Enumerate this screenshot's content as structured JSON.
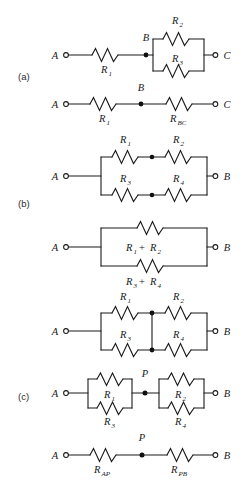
{
  "figure": {
    "type": "circuit-diagram",
    "width": 252,
    "height": 483,
    "background_color": "#ffffff",
    "ink_color": "#1a1a1a",
    "panels": [
      {
        "id": "a",
        "label": "(a)",
        "label_x": 18,
        "label_y": 80,
        "circuits": [
          {
            "id": "a1",
            "description": "R1 in series with parallel combination of R2 and R3 between terminals A and C, node B between them",
            "terminals": [
              {
                "name": "A",
                "x": 64,
                "y": 55
              },
              {
                "name": "C",
                "x": 218,
                "y": 55
              }
            ],
            "nodes": [
              {
                "name": "B",
                "x": 146,
                "y": 55
              }
            ],
            "resistors": [
              {
                "name": "R",
                "sub": "1",
                "x": 106,
                "y": 55,
                "orient": "h",
                "label_pos": "below"
              },
              {
                "name": "R",
                "sub": "2",
                "x": 178,
                "y": 39,
                "orient": "h",
                "label_pos": "above"
              },
              {
                "name": "R",
                "sub": "3",
                "x": 178,
                "y": 71,
                "orient": "h",
                "label_pos": "above"
              }
            ]
          },
          {
            "id": "a2",
            "description": "Simplified: R1 in series with equivalent R_BC between A and C via node B",
            "terminals": [
              {
                "name": "A",
                "x": 64,
                "y": 104
              },
              {
                "name": "C",
                "x": 218,
                "y": 104
              }
            ],
            "nodes": [
              {
                "name": "B",
                "x": 141,
                "y": 104
              }
            ],
            "resistors": [
              {
                "name": "R",
                "sub": "1",
                "x": 104,
                "y": 104,
                "orient": "h",
                "label_pos": "below"
              },
              {
                "name": "R",
                "sub": "BC",
                "x": 180,
                "y": 104,
                "orient": "h",
                "label_pos": "below"
              }
            ]
          }
        ]
      },
      {
        "id": "b",
        "label": "(b)",
        "label_x": 18,
        "label_y": 207,
        "circuits": [
          {
            "id": "b1",
            "description": "Two branches in parallel between A and B: top branch R1 then R2, bottom branch R3 then R4, with junction dots at branch midpoints",
            "terminals": [
              {
                "name": "A",
                "x": 64,
                "y": 176
              },
              {
                "name": "B",
                "x": 218,
                "y": 176
              }
            ],
            "resistors": [
              {
                "name": "R",
                "sub": "1",
                "x": 127,
                "y": 157,
                "orient": "h",
                "label_pos": "above"
              },
              {
                "name": "R",
                "sub": "2",
                "x": 180,
                "y": 157,
                "orient": "h",
                "label_pos": "above"
              },
              {
                "name": "R",
                "sub": "3",
                "x": 127,
                "y": 195,
                "orient": "h",
                "label_pos": "above"
              },
              {
                "name": "R",
                "sub": "4",
                "x": 180,
                "y": 195,
                "orient": "h",
                "label_pos": "above"
              }
            ]
          },
          {
            "id": "b2",
            "description": "Simplified: parallel of series sums (R1 + R2) on top branch and (R3 + R4) on bottom branch, between A and B",
            "terminals": [
              {
                "name": "A",
                "x": 64,
                "y": 247
              },
              {
                "name": "B",
                "x": 218,
                "y": 247
              }
            ],
            "branch_labels": [
              {
                "text": "R_1 + R_2",
                "x": 152,
                "y": 249,
                "position": "inside"
              },
              {
                "text": "R_3 + R_4",
                "x": 152,
                "y": 283,
                "position": "below"
              }
            ],
            "resistors": [
              {
                "name": "",
                "sub": "",
                "x": 152,
                "y": 228,
                "orient": "h",
                "label_pos": "none"
              },
              {
                "name": "",
                "sub": "",
                "x": 152,
                "y": 266,
                "orient": "h",
                "label_pos": "none"
              }
            ]
          }
        ]
      },
      {
        "id": "c",
        "label": "(c)",
        "label_x": 18,
        "label_y": 400,
        "circuits": [
          {
            "id": "c1",
            "description": "Bridge-like network: top branch R1 then R2, bottom branch R3 then R4, with a vertical wire shorting the two midpoint junctions, between A and B",
            "terminals": [
              {
                "name": "A",
                "x": 64,
                "y": 331
              },
              {
                "name": "B",
                "x": 218,
                "y": 331
              }
            ],
            "resistors": [
              {
                "name": "R",
                "sub": "1",
                "x": 127,
                "y": 313,
                "orient": "h",
                "label_pos": "above"
              },
              {
                "name": "R",
                "sub": "2",
                "x": 180,
                "y": 313,
                "orient": "h",
                "label_pos": "above"
              },
              {
                "name": "R",
                "sub": "3",
                "x": 127,
                "y": 350,
                "orient": "h",
                "label_pos": "above"
              },
              {
                "name": "R",
                "sub": "4",
                "x": 180,
                "y": 350,
                "orient": "h",
                "label_pos": "above"
              }
            ]
          },
          {
            "id": "c2",
            "description": "Redrawn: R1 parallel R3 in series with R2 parallel R4, joined at node P, between A and B",
            "terminals": [
              {
                "name": "A",
                "x": 64,
                "y": 393
              },
              {
                "name": "B",
                "x": 218,
                "y": 393
              }
            ],
            "nodes": [
              {
                "name": "P",
                "x": 145,
                "y": 393
              }
            ],
            "resistors": [
              {
                "name": "R",
                "sub": "1",
                "x": 110,
                "y": 379,
                "orient": "h",
                "label_pos": "inside"
              },
              {
                "name": "R",
                "sub": "3",
                "x": 110,
                "y": 408,
                "orient": "h",
                "label_pos": "below"
              },
              {
                "name": "R",
                "sub": "2",
                "x": 182,
                "y": 379,
                "orient": "h",
                "label_pos": "inside"
              },
              {
                "name": "R",
                "sub": "4",
                "x": 182,
                "y": 408,
                "orient": "h",
                "label_pos": "below"
              }
            ]
          },
          {
            "id": "c3",
            "description": "Final simplification: R_AP in series with R_PB through node P, between A and B",
            "terminals": [
              {
                "name": "A",
                "x": 64,
                "y": 455
              },
              {
                "name": "B",
                "x": 218,
                "y": 455
              }
            ],
            "nodes": [
              {
                "name": "P",
                "x": 142,
                "y": 455
              }
            ],
            "resistors": [
              {
                "name": "R",
                "sub": "AP",
                "x": 104,
                "y": 455,
                "orient": "h",
                "label_pos": "below"
              },
              {
                "name": "R",
                "sub": "PB",
                "x": 181,
                "y": 455,
                "orient": "h",
                "label_pos": "below"
              }
            ]
          }
        ]
      }
    ],
    "symbols": {
      "resistor": "zigzag",
      "terminal": "open-circle",
      "junction": "filled-dot"
    },
    "text": {
      "panel_a": "(a)",
      "panel_b": "(b)",
      "panel_c": "(c)",
      "A": "A",
      "B": "B",
      "C": "C",
      "P": "P",
      "R": "R",
      "sub1": "1",
      "sub2": "2",
      "sub3": "3",
      "sub4": "4",
      "subBC": "BC",
      "subAP": "AP",
      "subPB": "PB",
      "plus": "+"
    }
  }
}
